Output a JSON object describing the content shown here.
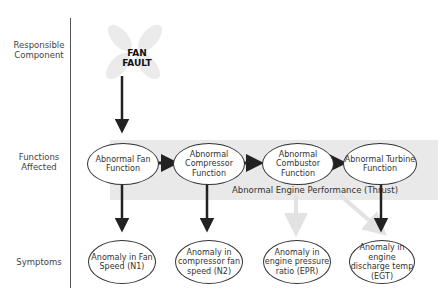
{
  "rows": {
    "component": "Responsible Component",
    "functions": "Functions Affected",
    "symptoms": "Symptoms"
  },
  "fault": {
    "line1": "FAN",
    "line2": "FAULT"
  },
  "functions": [
    {
      "label": "Abnormal Fan Function"
    },
    {
      "label": "Abnormal Compressor Function"
    },
    {
      "label": "Abnormal Combustor Function"
    },
    {
      "label": "Abnormal Turbine Function"
    }
  ],
  "performance_label": "Abnormal Engine Performance (Thrust)",
  "symptoms": [
    {
      "label": "Anomaly in Fan Speed (N1)"
    },
    {
      "label": "Anomaly in compressor fan speed (N2)"
    },
    {
      "label": "Anomaly in engine pressure ratio (EPR)"
    },
    {
      "label": "Anomaly in engine discharge temp (EGT)"
    }
  ],
  "colors": {
    "arrow": "#222222",
    "faded_arrow": "#e4e4e4",
    "band": "#e9e9e9",
    "fan_icon": "#ebebeb"
  }
}
